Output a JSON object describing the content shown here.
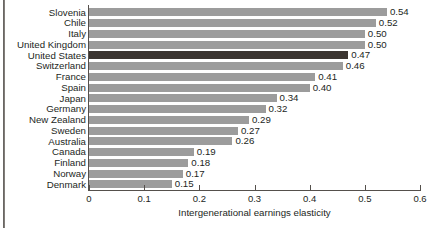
{
  "chart_data": {
    "type": "bar",
    "orientation": "horizontal",
    "title": "",
    "xlabel": "Intergenerational earnings elasticity",
    "ylabel": "",
    "xlim": [
      0,
      0.6
    ],
    "xticks": [
      "0",
      "0.1",
      "0.2",
      "0.3",
      "0.4",
      "0.5",
      "0.6"
    ],
    "xtick_values": [
      0,
      0.1,
      0.2,
      0.3,
      0.4,
      0.5,
      0.6
    ],
    "grid": false,
    "legend": "none",
    "bar_color": "#9c9c9c",
    "highlight_color": "#3b3531",
    "highlight_category": "United States",
    "categories": [
      "Slovenia",
      "Chile",
      "Italy",
      "United Kingdom",
      "United States",
      "Switzerland",
      "France",
      "Spain",
      "Japan",
      "Germany",
      "New Zealand",
      "Sweden",
      "Australia",
      "Canada",
      "Finland",
      "Norway",
      "Denmark"
    ],
    "values": [
      0.54,
      0.52,
      0.5,
      0.5,
      0.47,
      0.46,
      0.41,
      0.4,
      0.34,
      0.32,
      0.29,
      0.27,
      0.26,
      0.19,
      0.18,
      0.17,
      0.15
    ],
    "value_labels": [
      "0.54",
      "0.52",
      "0.50",
      "0.50",
      "0.47",
      "0.46",
      "0.41",
      "0.40",
      "0.34",
      "0.32",
      "0.29",
      "0.27",
      "0.26",
      "0.19",
      "0.18",
      "0.17",
      "0.15"
    ]
  }
}
